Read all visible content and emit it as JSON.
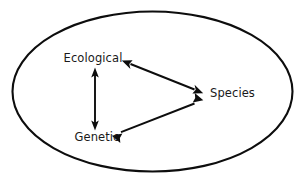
{
  "diagram": {
    "type": "concept-diagram",
    "background_color": "#ffffff",
    "stroke_color": "#0d0d0d",
    "text_color": "#1a1a1a",
    "boundary": {
      "shape": "ellipse",
      "label": "",
      "cx": 152.5,
      "cy": 91.5,
      "rx": 140,
      "ry": 80,
      "stroke_width": 2.1,
      "fill": "#ffffff"
    },
    "nodes": [
      {
        "id": "ecological",
        "label": "Ecological",
        "x": 93,
        "y": 62,
        "anchor": "middle"
      },
      {
        "id": "species",
        "label": "Species",
        "x": 210,
        "y": 97,
        "anchor": "start"
      },
      {
        "id": "genetic",
        "label": "Genetic",
        "x": 97,
        "y": 141,
        "anchor": "middle"
      }
    ],
    "edges": [
      {
        "id": "ecological-genetic",
        "from": "ecological",
        "to": "genetic",
        "direction": "bidirectional",
        "x1": 95,
        "y1": 68,
        "x2": 95,
        "y2": 130
      },
      {
        "id": "ecological-species",
        "from": "ecological",
        "to": "species",
        "direction": "bidirectional",
        "x1": 122,
        "y1": 60.5,
        "x2": 203,
        "y2": 93
      },
      {
        "id": "genetic-species",
        "from": "genetic",
        "to": "species",
        "direction": "bidirectional",
        "x1": 112,
        "y1": 135.5,
        "x2": 203,
        "y2": 100
      }
    ]
  }
}
